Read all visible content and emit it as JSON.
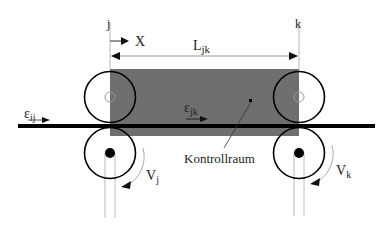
{
  "diagram": {
    "colors": {
      "control_volume": "#6f6f6f",
      "line": "#000000",
      "guide": "#b8b8b8",
      "text": "#222222"
    },
    "labels": {
      "station_j": "j",
      "station_k": "k",
      "x_axis": "X",
      "length": "L",
      "length_sub": "jk",
      "strain_in": "ε",
      "strain_in_sub": "ij",
      "strain_span": "ε",
      "strain_span_sub": "jk",
      "control_volume": "Kontrollraum",
      "velocity_j": "V",
      "velocity_j_sub": "j",
      "velocity_k": "V",
      "velocity_k_sub": "k"
    },
    "rollers": [
      {
        "id": "j-upper",
        "type": "idler"
      },
      {
        "id": "j-lower",
        "type": "driven"
      },
      {
        "id": "k-upper",
        "type": "idler"
      },
      {
        "id": "k-lower",
        "type": "driven"
      }
    ]
  }
}
